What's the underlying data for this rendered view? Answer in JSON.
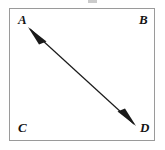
{
  "figure": {
    "name": "rectangle-with-diagonal-double-arrow",
    "background_color": "#ffffff",
    "rectangle": {
      "stroke_color": "#9a9a9a",
      "stroke_width": 1.5,
      "fill_color": "#ffffff",
      "x": 9,
      "y": 8,
      "width": 146,
      "height": 133
    },
    "arrow": {
      "style": "double-headed",
      "stroke_color": "#1a1a1a",
      "stroke_width": 1.2,
      "head_fill": "#1a1a1a",
      "from_x": 28,
      "from_y": 27,
      "to_x": 136,
      "to_y": 126,
      "direction": "diagonal from upper-left vertex A toward lower-right vertex D"
    },
    "vertices": [
      {
        "id": "a",
        "label": "A",
        "position": "top-left",
        "x": 18,
        "y": 13
      },
      {
        "id": "b",
        "label": "B",
        "position": "top-right",
        "x": 139,
        "y": 13
      },
      {
        "id": "c",
        "label": "C",
        "position": "bottom-left",
        "x": 18,
        "y": 121
      },
      {
        "id": "d",
        "label": "D",
        "position": "bottom-right",
        "x": 140,
        "y": 121
      }
    ]
  }
}
